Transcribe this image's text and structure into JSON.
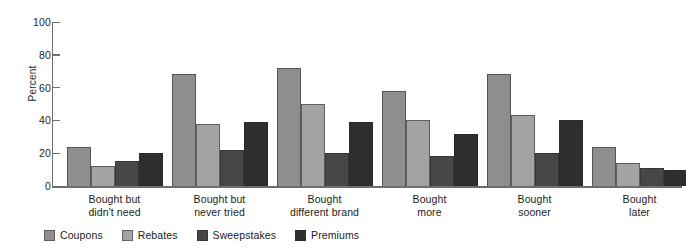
{
  "chart_data": {
    "type": "bar",
    "title": "",
    "subtitle": "",
    "xlabel": "",
    "ylabel": "Percent",
    "ylim": [
      0,
      100
    ],
    "yticks": [
      0,
      20,
      40,
      60,
      80,
      100
    ],
    "grid": false,
    "legend_position": "bottom-left",
    "categories": [
      "Bought but didn't need",
      "Bought but never tried",
      "Bought different brand",
      "Bought more",
      "Bought sooner",
      "Bought later"
    ],
    "category_lines": [
      [
        "Bought but",
        "didn't need"
      ],
      [
        "Bought but",
        "never tried"
      ],
      [
        "Bought",
        "different brand"
      ],
      [
        "Bought",
        "more"
      ],
      [
        "Bought",
        "sooner"
      ],
      [
        "Bought",
        "later"
      ]
    ],
    "series": [
      {
        "name": "Coupons",
        "color": "#8e8e8e",
        "values": [
          24,
          68,
          72,
          58,
          68,
          24
        ]
      },
      {
        "name": "Rebates",
        "color": "#a3a3a3",
        "values": [
          12,
          38,
          50,
          40,
          43,
          14
        ]
      },
      {
        "name": "Sweepstakes",
        "color": "#474747",
        "values": [
          15,
          22,
          20,
          18,
          20,
          11
        ]
      },
      {
        "name": "Premiums",
        "color": "#2e2e2e",
        "values": [
          20,
          39,
          39,
          32,
          40,
          10
        ]
      }
    ]
  },
  "axis": {
    "y_label": "Percent",
    "y_ticks": [
      "100",
      "80",
      "60",
      "40",
      "20",
      "0"
    ]
  },
  "legend": {
    "entries": [
      {
        "label": "Coupons"
      },
      {
        "label": "Rebates"
      },
      {
        "label": "Sweepstakes"
      },
      {
        "label": "Premiums"
      }
    ]
  },
  "colors": {
    "axis": "#6d6d6d",
    "text": "#1b1b1b",
    "background": "#ffffff",
    "coupons": "#8e8e8e",
    "rebates": "#a3a3a3",
    "sweepstakes": "#474747",
    "premiums": "#2e2e2e"
  }
}
